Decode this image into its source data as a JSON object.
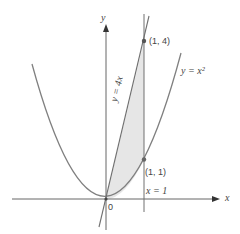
{
  "figure": {
    "axes": {
      "x_label": "x",
      "y_label": "y",
      "origin_label": "0"
    },
    "curves": [
      {
        "name": "parabola",
        "label": "y = x²"
      },
      {
        "name": "line",
        "label": "y = 4x"
      },
      {
        "name": "vertical-line",
        "label": "x = 1"
      }
    ],
    "points": [
      {
        "label": "(1, 4)",
        "x": 1,
        "y": 4
      },
      {
        "label": "(1, 1)",
        "x": 1,
        "y": 1
      }
    ],
    "shaded_region": "area between y = 4x and y = x² for 0 ≤ x ≤ 1",
    "colors": {
      "curve": "#777777",
      "shade": "#e4e4e4",
      "axis": "#555555"
    }
  }
}
